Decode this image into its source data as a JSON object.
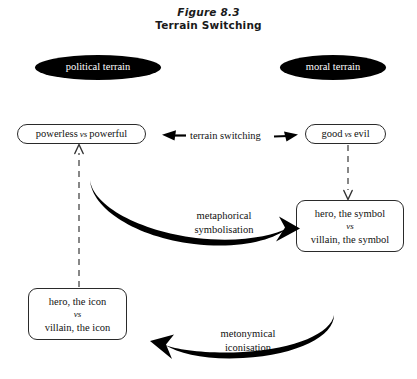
{
  "figure": {
    "number": "Figure 8.3",
    "title": "Terrain Switching"
  },
  "terrains": [
    {
      "id": "political",
      "label": "political terrain",
      "fill": "#000000",
      "text_color": "#ffffff"
    },
    {
      "id": "moral",
      "label": "moral terrain",
      "fill": "#000000",
      "text_color": "#ffffff"
    }
  ],
  "nodes": {
    "powerless": {
      "left": "powerless",
      "vs": "vs",
      "right": "powerful"
    },
    "good": {
      "left": "good",
      "vs": "vs",
      "right": "evil"
    },
    "symbol": {
      "line1": "hero, the symbol",
      "vs": "vs",
      "line2": "villain, the symbol"
    },
    "icon": {
      "line1": "hero, the icon",
      "vs": "vs",
      "line2": "villain, the icon"
    }
  },
  "edges": {
    "terrain_switching": "terrain switching",
    "metaphorical_line1": "metaphorical",
    "metaphorical_line2": "symbolisation",
    "metonymical_line1": "metonymical",
    "metonymical_line2": "iconisation"
  },
  "colors": {
    "stroke": "#2a2a2a",
    "dashed": "#555555",
    "thick_arrow": "#000000",
    "background": "#ffffff"
  }
}
